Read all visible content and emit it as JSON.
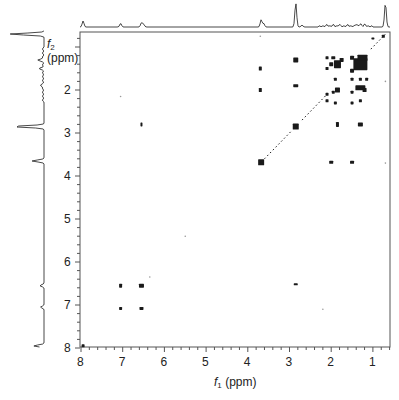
{
  "chart_data": {
    "type": "heatmap",
    "subtype": "2D NMR COSY contour plot",
    "title": "",
    "xlabel": "f1 (ppm)",
    "ylabel": "f2 (ppm)",
    "x_axis": {
      "symbol": "f",
      "subscript": "1",
      "unit": "(ppm)",
      "range": [
        8.05,
        0.6
      ],
      "reversed": true,
      "ticks": [
        8,
        7,
        6,
        5,
        4,
        3,
        2,
        1
      ],
      "minor_step": 0.2
    },
    "y_axis": {
      "symbol": "f",
      "subscript": "2",
      "unit": "(ppm)",
      "range": [
        0.65,
        8.0
      ],
      "reversed": true,
      "ticks": [
        2,
        3,
        4,
        5,
        6,
        7,
        8
      ],
      "minor_step": 0.2
    },
    "grid": false,
    "legend": null,
    "projection_top": {
      "description": "1D 1H spectrum along f1",
      "peaks": [
        {
          "ppm": 7.95,
          "h": 0.25
        },
        {
          "ppm": 7.05,
          "h": 0.15
        },
        {
          "ppm": 6.55,
          "h": 0.18
        },
        {
          "ppm": 6.5,
          "h": 0.12
        },
        {
          "ppm": 3.68,
          "h": 0.3
        },
        {
          "ppm": 3.62,
          "h": 0.15
        },
        {
          "ppm": 2.85,
          "h": 1.0
        },
        {
          "ppm": 2.7,
          "h": 0.08
        },
        {
          "ppm": 2.1,
          "h": 0.06
        },
        {
          "ppm": 1.95,
          "h": 0.06
        },
        {
          "ppm": 1.8,
          "h": 0.07
        },
        {
          "ppm": 1.6,
          "h": 0.06
        },
        {
          "ppm": 1.4,
          "h": 0.09
        },
        {
          "ppm": 1.3,
          "h": 0.1
        },
        {
          "ppm": 1.2,
          "h": 0.08
        },
        {
          "ppm": 0.7,
          "h": 1.0
        }
      ]
    },
    "projection_left": {
      "description": "1D 1H spectrum along f2",
      "peaks": [
        {
          "ppm": 0.7,
          "h": 1.0
        },
        {
          "ppm": 1.3,
          "h": 0.15
        },
        {
          "ppm": 1.5,
          "h": 0.1
        },
        {
          "ppm": 1.9,
          "h": 0.08
        },
        {
          "ppm": 2.85,
          "h": 0.9
        },
        {
          "ppm": 3.65,
          "h": 0.35
        },
        {
          "ppm": 6.55,
          "h": 0.12
        },
        {
          "ppm": 7.05,
          "h": 0.1
        },
        {
          "ppm": 7.95,
          "h": 0.3
        }
      ]
    },
    "cross_peaks": [
      {
        "f1": 0.75,
        "f2": 0.75,
        "w": 3,
        "h": 3
      },
      {
        "f1": 1.0,
        "f2": 0.8,
        "w": 3,
        "h": 2
      },
      {
        "f1": 1.3,
        "f2": 1.4,
        "w": 14,
        "h": 12
      },
      {
        "f1": 1.25,
        "f2": 1.25,
        "w": 10,
        "h": 6
      },
      {
        "f1": 1.5,
        "f2": 1.25,
        "w": 4,
        "h": 4
      },
      {
        "f1": 1.5,
        "f2": 1.55,
        "w": 4,
        "h": 4
      },
      {
        "f1": 1.75,
        "f2": 1.3,
        "w": 4,
        "h": 4
      },
      {
        "f1": 1.85,
        "f2": 1.4,
        "w": 7,
        "h": 8
      },
      {
        "f1": 1.95,
        "f2": 1.25,
        "w": 4,
        "h": 3
      },
      {
        "f1": 2.1,
        "f2": 1.25,
        "w": 3,
        "h": 3
      },
      {
        "f1": 2.1,
        "f2": 1.5,
        "w": 3,
        "h": 3
      },
      {
        "f1": 2.0,
        "f2": 1.4,
        "w": 4,
        "h": 4
      },
      {
        "f1": 1.9,
        "f2": 1.75,
        "w": 3,
        "h": 3
      },
      {
        "f1": 1.5,
        "f2": 1.75,
        "w": 3,
        "h": 3
      },
      {
        "f1": 1.3,
        "f2": 1.75,
        "w": 3,
        "h": 3
      },
      {
        "f1": 1.15,
        "f2": 1.75,
        "w": 3,
        "h": 3
      },
      {
        "f1": 1.3,
        "f2": 1.95,
        "w": 10,
        "h": 5
      },
      {
        "f1": 1.2,
        "f2": 2.0,
        "w": 4,
        "h": 4
      },
      {
        "f1": 1.5,
        "f2": 2.05,
        "w": 3,
        "h": 3
      },
      {
        "f1": 1.85,
        "f2": 2.0,
        "w": 5,
        "h": 5
      },
      {
        "f1": 1.95,
        "f2": 2.05,
        "w": 3,
        "h": 3
      },
      {
        "f1": 2.1,
        "f2": 2.1,
        "w": 3,
        "h": 3
      },
      {
        "f1": 2.1,
        "f2": 2.25,
        "w": 3,
        "h": 3
      },
      {
        "f1": 1.9,
        "f2": 2.3,
        "w": 3,
        "h": 3
      },
      {
        "f1": 1.5,
        "f2": 2.3,
        "w": 3,
        "h": 3
      },
      {
        "f1": 1.3,
        "f2": 2.25,
        "w": 3,
        "h": 3
      },
      {
        "f1": 2.85,
        "f2": 1.3,
        "w": 5,
        "h": 5
      },
      {
        "f1": 2.85,
        "f2": 1.9,
        "w": 5,
        "h": 3
      },
      {
        "f1": 2.85,
        "f2": 2.85,
        "w": 6,
        "h": 6
      },
      {
        "f1": 1.85,
        "f2": 2.8,
        "w": 3,
        "h": 5
      },
      {
        "f1": 1.3,
        "f2": 2.8,
        "w": 5,
        "h": 4
      },
      {
        "f1": 3.7,
        "f2": 1.5,
        "w": 3,
        "h": 4
      },
      {
        "f1": 3.7,
        "f2": 2.0,
        "w": 3,
        "h": 4
      },
      {
        "f1": 3.68,
        "f2": 3.68,
        "w": 6,
        "h": 6
      },
      {
        "f1": 2.0,
        "f2": 3.68,
        "w": 4,
        "h": 3
      },
      {
        "f1": 1.5,
        "f2": 3.68,
        "w": 4,
        "h": 3
      },
      {
        "f1": 6.55,
        "f2": 2.8,
        "w": 2,
        "h": 4
      },
      {
        "f1": 7.05,
        "f2": 6.55,
        "w": 3,
        "h": 4
      },
      {
        "f1": 6.55,
        "f2": 6.55,
        "w": 5,
        "h": 4
      },
      {
        "f1": 7.05,
        "f2": 7.08,
        "w": 3,
        "h": 3
      },
      {
        "f1": 6.55,
        "f2": 7.08,
        "w": 4,
        "h": 3
      },
      {
        "f1": 2.85,
        "f2": 6.52,
        "w": 4,
        "h": 2
      },
      {
        "f1": 7.95,
        "f2": 7.95,
        "w": 3,
        "h": 3
      }
    ],
    "diagonal_traces": [
      {
        "from": [
          3.6,
          3.6
        ],
        "to": [
          2.95,
          2.95
        ]
      },
      {
        "from": [
          2.7,
          2.7
        ],
        "to": [
          2.1,
          2.1
        ]
      },
      {
        "from": [
          1.05,
          1.05
        ],
        "to": [
          0.7,
          0.7
        ]
      }
    ],
    "faint_points": [
      {
        "f1": 7.05,
        "f2": 2.15
      },
      {
        "f1": 6.35,
        "f2": 6.35
      },
      {
        "f1": 5.5,
        "f2": 5.4
      },
      {
        "f1": 3.7,
        "f2": 0.75
      },
      {
        "f1": 2.2,
        "f2": 7.1
      },
      {
        "f1": 0.7,
        "f2": 3.7
      },
      {
        "f1": 0.7,
        "f2": 1.8
      }
    ]
  },
  "labels": {
    "x_axis_title": {
      "symbol": "f",
      "subscript": "1",
      "unit": "(ppm)"
    },
    "y_axis_title": {
      "symbol": "f",
      "subscript": "2",
      "unit": "(ppm)"
    }
  },
  "colors": {
    "ink": "#1a1a1a",
    "frame": "#555555",
    "background": "#ffffff"
  }
}
